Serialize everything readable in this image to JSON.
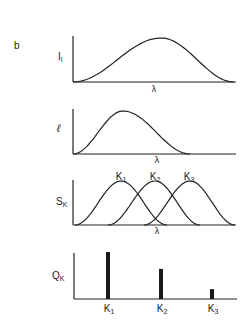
{
  "figure": {
    "panel_letter": "b",
    "panels": [
      {
        "id": "intensity",
        "ylabel_main": "I",
        "ylabel_sub": "I",
        "xlabel": "λ",
        "curve": "broad bell peaking center-right of wavelength axis"
      },
      {
        "id": "ell",
        "ylabel_main": "ℓ",
        "ylabel_sub": "",
        "xlabel": "λ",
        "curve": "bell peaking early on wavelength axis"
      },
      {
        "id": "sensitivities",
        "ylabel_main": "S",
        "ylabel_sub": "K",
        "xlabel": "λ",
        "curve_labels": [
          {
            "main": "K",
            "sub": "1"
          },
          {
            "main": "K",
            "sub": "2"
          },
          {
            "main": "K",
            "sub": "3"
          }
        ]
      },
      {
        "id": "responses",
        "ylabel_main": "Q",
        "ylabel_sub": "K",
        "xlabel": ""
      }
    ]
  },
  "chart_data": {
    "type": "bar",
    "title": "",
    "xlabel": "",
    "ylabel": "Q_K",
    "categories": [
      "K1",
      "K2",
      "K3"
    ],
    "category_labels": [
      {
        "main": "K",
        "sub": "1"
      },
      {
        "main": "K",
        "sub": "2"
      },
      {
        "main": "K",
        "sub": "3"
      }
    ],
    "values": [
      1.0,
      0.64,
      0.21
    ],
    "ylim": [
      0,
      1.0
    ],
    "grid": false
  }
}
